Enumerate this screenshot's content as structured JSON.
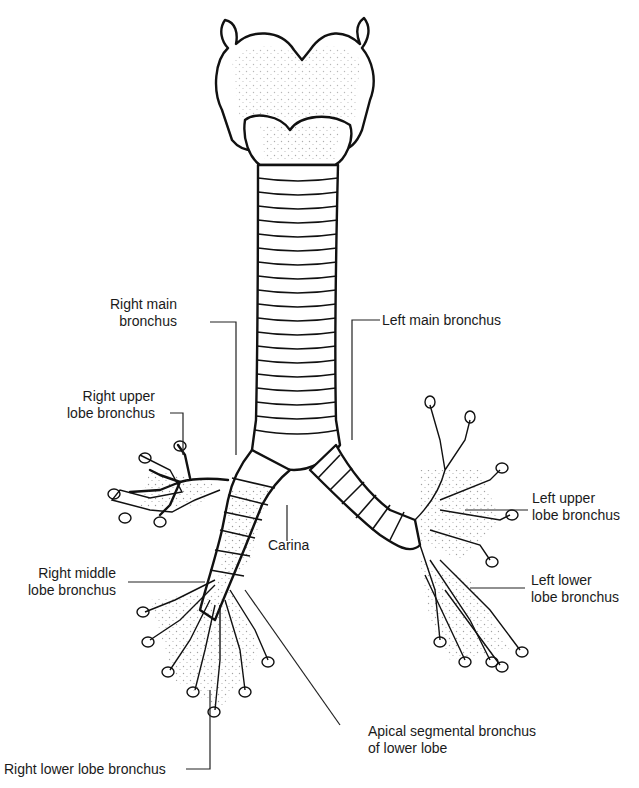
{
  "diagram": {
    "structures": [
      "larynx",
      "trachea",
      "carina",
      "right bronchial tree",
      "left bronchial tree"
    ],
    "labels": [
      {
        "id": "right_main",
        "lines": [
          "Right main",
          "bronchus"
        ]
      },
      {
        "id": "left_main",
        "lines": [
          "Left main bronchus"
        ]
      },
      {
        "id": "right_upper",
        "lines": [
          "Right upper",
          "lobe bronchus"
        ]
      },
      {
        "id": "left_upper",
        "lines": [
          "Left upper",
          "lobe bronchus"
        ]
      },
      {
        "id": "carina",
        "lines": [
          "Carina"
        ]
      },
      {
        "id": "right_middle",
        "lines": [
          "Right middle",
          "lobe bronchus"
        ]
      },
      {
        "id": "left_lower",
        "lines": [
          "Left lower",
          "lobe bronchus"
        ]
      },
      {
        "id": "apical",
        "lines": [
          "Apical segmental bronchus",
          "of lower lobe"
        ]
      },
      {
        "id": "right_lower",
        "lines": [
          "Right lower lobe bronchus"
        ]
      }
    ]
  },
  "colors": {
    "line": "#111111",
    "text": "#1a1a1a",
    "background": "#ffffff"
  }
}
